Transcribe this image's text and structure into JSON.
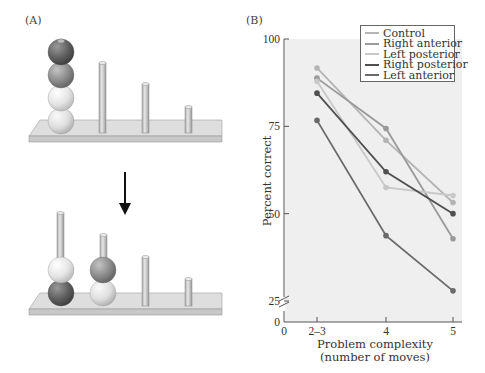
{
  "panel_a": {
    "label": "(A)",
    "arrow_icon": "down-arrow-icon",
    "top_state": {
      "peg1": [
        "dark",
        "medium-dark",
        "light",
        "lighter"
      ],
      "peg2": [],
      "peg3": [],
      "peg4": []
    },
    "bottom_state": {
      "peg1": [
        "dark",
        "light"
      ],
      "peg2": [
        "lighter",
        "medium-dark"
      ],
      "peg3": [],
      "peg4": []
    }
  },
  "panel_b": {
    "label": "(B)"
  },
  "chart_data": {
    "type": "line",
    "title": "",
    "xlabel": "Problem complexity\n(number of moves)",
    "xlabel_line1": "Problem complexity",
    "xlabel_line2": "(number of moves)",
    "ylabel": "Percent correct",
    "x": [
      "2–3",
      "4",
      "5"
    ],
    "x_ticks": [
      "0",
      "2–3",
      "4",
      "5"
    ],
    "y_ticks": [
      "0",
      "25",
      "50",
      "75",
      "100"
    ],
    "ylim": [
      25,
      100
    ],
    "axis_break": true,
    "grid": false,
    "legend_position": "top-right",
    "series": [
      {
        "name": "Control",
        "color": "#b4b4b4",
        "values": [
          91.7,
          71.0,
          53.2
        ]
      },
      {
        "name": "Right anterior",
        "color": "#9a9a9a",
        "values": [
          88.8,
          74.4,
          42.8
        ]
      },
      {
        "name": "Left posterior",
        "color": "#c8c8c8",
        "values": [
          87.9,
          57.5,
          55.2
        ]
      },
      {
        "name": "Right posterior",
        "color": "#505050",
        "values": [
          84.5,
          62.0,
          50.0
        ]
      },
      {
        "name": "Left anterior",
        "color": "#6a6a6a",
        "values": [
          76.7,
          43.7,
          27.9
        ]
      }
    ]
  }
}
